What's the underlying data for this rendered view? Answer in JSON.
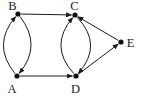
{
  "diagram": {
    "type": "directed-graph",
    "background_color": "#ffffff",
    "line_color": "#1c1c1c",
    "node_color": "#111111",
    "node_radius": 2.6,
    "line_width": 1,
    "label_font_size": 12.5,
    "nodes": [
      {
        "id": "A",
        "label": "A",
        "x": 17,
        "y": 76,
        "label_x": 12,
        "label_y": 92.5
      },
      {
        "id": "B",
        "label": "B",
        "x": 18,
        "y": 14,
        "label_x": 12.5,
        "label_y": 10
      },
      {
        "id": "C",
        "label": "C",
        "x": 75,
        "y": 15,
        "label_x": 74.5,
        "label_y": 9.5
      },
      {
        "id": "D",
        "label": "D",
        "x": 76,
        "y": 76,
        "label_x": 75.5,
        "label_y": 92.5
      },
      {
        "id": "E",
        "label": "E",
        "x": 121,
        "y": 42,
        "label_x": 130.5,
        "label_y": 46.5
      }
    ],
    "edges": [
      {
        "from": "B",
        "to": "C",
        "bow": 0
      },
      {
        "from": "A",
        "to": "D",
        "bow": 0
      },
      {
        "from": "A",
        "to": "B",
        "bow": -13
      },
      {
        "from": "B",
        "to": "A",
        "bow": -12.5
      },
      {
        "from": "D",
        "to": "C",
        "bow": -13.5
      },
      {
        "from": "C",
        "to": "D",
        "bow": -14
      },
      {
        "from": "D",
        "to": "E",
        "bow": 0
      },
      {
        "from": "E",
        "to": "C",
        "bow": 0
      }
    ]
  }
}
